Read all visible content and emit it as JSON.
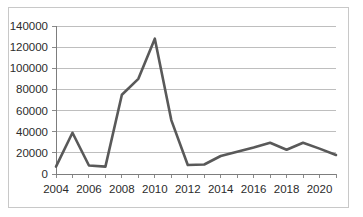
{
  "chart_data": {
    "type": "line",
    "title": "",
    "subtitle": "",
    "xlabel": "",
    "ylabel": "",
    "x": [
      2004,
      2005,
      2006,
      2007,
      2008,
      2009,
      2010,
      2011,
      2012,
      2013,
      2014,
      2015,
      2016,
      2017,
      2018,
      2019,
      2020,
      2021
    ],
    "series": [
      {
        "name": "series-1",
        "color": "#595959",
        "values": [
          7000,
          39000,
          8000,
          7000,
          75000,
          90000,
          128000,
          51000,
          8500,
          9000,
          17000,
          21000,
          25000,
          29500,
          23000,
          29500,
          24000,
          18000
        ]
      }
    ],
    "ylim": [
      0,
      140000
    ],
    "ytick_values": [
      0,
      20000,
      40000,
      60000,
      80000,
      100000,
      120000,
      140000
    ],
    "ytick_labels": [
      "0",
      "20000",
      "40000",
      "60000",
      "80000",
      "100000",
      "120000",
      "140000"
    ],
    "xlim": [
      2004,
      2021
    ],
    "xtick_values": [
      2004,
      2005,
      2006,
      2007,
      2008,
      2009,
      2010,
      2011,
      2012,
      2013,
      2014,
      2015,
      2016,
      2017,
      2018,
      2019,
      2020,
      2021
    ],
    "xtick_labels_shown": [
      "2004",
      "2006",
      "2008",
      "2010",
      "2012",
      "2014",
      "2016",
      "2018",
      "2020"
    ],
    "xtick_label_values": [
      2004,
      2006,
      2008,
      2010,
      2012,
      2014,
      2016,
      2018,
      2020
    ],
    "grid": "horizontal",
    "legend": "none",
    "annotations": []
  },
  "colors": {
    "line": "#595959",
    "gridline": "#aeaeae",
    "axis": "#7d7d7d",
    "border": "#c8c8c8",
    "background": "#ffffff",
    "text": "#2b2b2b"
  }
}
